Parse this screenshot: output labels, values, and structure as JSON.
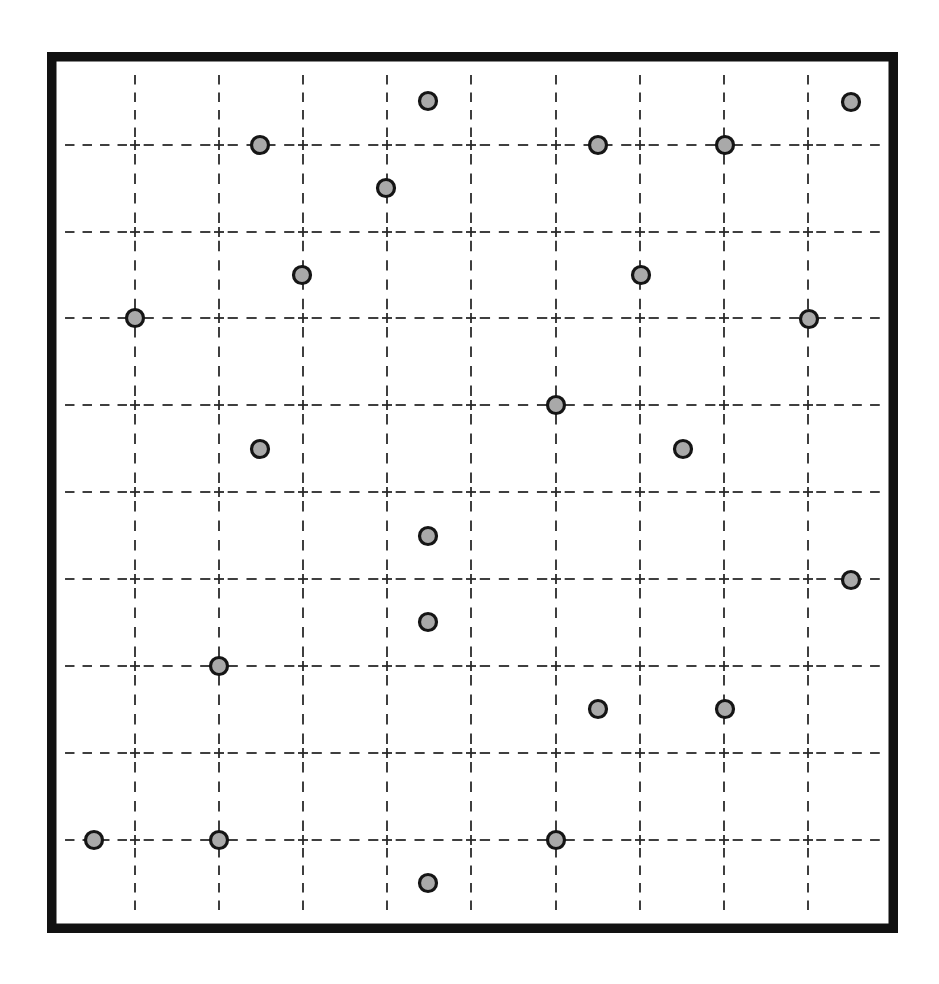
{
  "diagram": {
    "canvas": {
      "width": 939,
      "height": 984,
      "background": "#ffffff"
    },
    "frame": {
      "x": 47,
      "y": 52,
      "width": 851,
      "height": 881,
      "stroke_width": 9.5,
      "color": "#111111"
    },
    "grid": {
      "line_color": "#2a2a2a",
      "style": "dashed",
      "dashes_per_cell": 4,
      "cross_half_size": 5,
      "vertical_x": [
        135,
        219,
        303,
        387,
        471,
        556,
        640,
        724,
        808
      ],
      "vertical_span": [
        73,
        912
      ],
      "horizontal_y": [
        145,
        232,
        318,
        405,
        492,
        579,
        666,
        753,
        840
      ],
      "horizontal_span": [
        63,
        882
      ]
    },
    "dots": {
      "radius": 8.5,
      "fill": "#a9a9a9",
      "stroke": "#151515",
      "points": [
        {
          "x": 428,
          "y": 101
        },
        {
          "x": 851,
          "y": 102
        },
        {
          "x": 260,
          "y": 145
        },
        {
          "x": 598,
          "y": 145
        },
        {
          "x": 725,
          "y": 145
        },
        {
          "x": 386,
          "y": 188
        },
        {
          "x": 302,
          "y": 275
        },
        {
          "x": 641,
          "y": 275
        },
        {
          "x": 135,
          "y": 318
        },
        {
          "x": 809,
          "y": 319
        },
        {
          "x": 556,
          "y": 405
        },
        {
          "x": 260,
          "y": 449
        },
        {
          "x": 683,
          "y": 449
        },
        {
          "x": 428,
          "y": 536
        },
        {
          "x": 851,
          "y": 580
        },
        {
          "x": 428,
          "y": 622
        },
        {
          "x": 219,
          "y": 666
        },
        {
          "x": 598,
          "y": 709
        },
        {
          "x": 725,
          "y": 709
        },
        {
          "x": 94,
          "y": 840
        },
        {
          "x": 219,
          "y": 840
        },
        {
          "x": 556,
          "y": 840
        },
        {
          "x": 428,
          "y": 883
        }
      ]
    }
  }
}
